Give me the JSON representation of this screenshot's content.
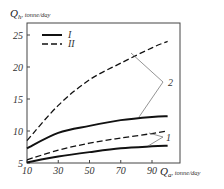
{
  "chart_data": {
    "type": "line",
    "title": "",
    "xlabel": "Q_a, tonne/day",
    "ylabel": "Q_h, tonne/day",
    "x_symbol": "Q",
    "x_sub": "a",
    "y_symbol": "Q",
    "y_sub": "h",
    "unit": ", tonne/day",
    "xlim": [
      10,
      102
    ],
    "ylim": [
      5,
      27
    ],
    "x_ticks": [
      10,
      30,
      50,
      70,
      90
    ],
    "y_ticks": [
      5,
      10,
      15,
      20,
      25
    ],
    "grid": false,
    "legend_position": "upper left",
    "legend": [
      {
        "label": "I",
        "style": "solid"
      },
      {
        "label": "II",
        "style": "dashed"
      }
    ],
    "x": [
      10,
      30,
      50,
      70,
      90,
      100
    ],
    "series": [
      {
        "name": "II-2",
        "group": "2",
        "style": "dashed",
        "values": [
          8.5,
          14,
          18,
          20.6,
          23,
          24
        ]
      },
      {
        "name": "I-2",
        "group": "2",
        "style": "solid",
        "values": [
          7.3,
          9.7,
          10.8,
          11.7,
          12.2,
          12.3
        ]
      },
      {
        "name": "II-1",
        "group": "1",
        "style": "dashed",
        "values": [
          5.5,
          7.0,
          8.1,
          8.9,
          9.6,
          10
        ]
      },
      {
        "name": "I-1",
        "group": "1",
        "style": "solid",
        "values": [
          5.1,
          6.0,
          6.7,
          7.3,
          7.6,
          7.7
        ]
      }
    ],
    "annotations": [
      {
        "text": "2",
        "points_to": [
          "II-2",
          "I-2"
        ]
      },
      {
        "text": "1",
        "points_to": [
          "II-1",
          "I-1"
        ]
      }
    ]
  }
}
